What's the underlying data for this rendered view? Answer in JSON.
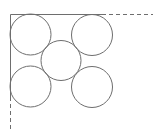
{
  "diagram": {
    "title": "",
    "stroke_color": "#6e6e6e",
    "circle_count": 5,
    "circles": [
      {
        "name": "top-left"
      },
      {
        "name": "top-right"
      },
      {
        "name": "center"
      },
      {
        "name": "bottom-left"
      },
      {
        "name": "bottom-right"
      }
    ],
    "boundaries": [
      {
        "name": "top-boundary",
        "style": "solid-then-dashed"
      },
      {
        "name": "left-boundary",
        "style": "solid-then-dashed"
      }
    ]
  }
}
